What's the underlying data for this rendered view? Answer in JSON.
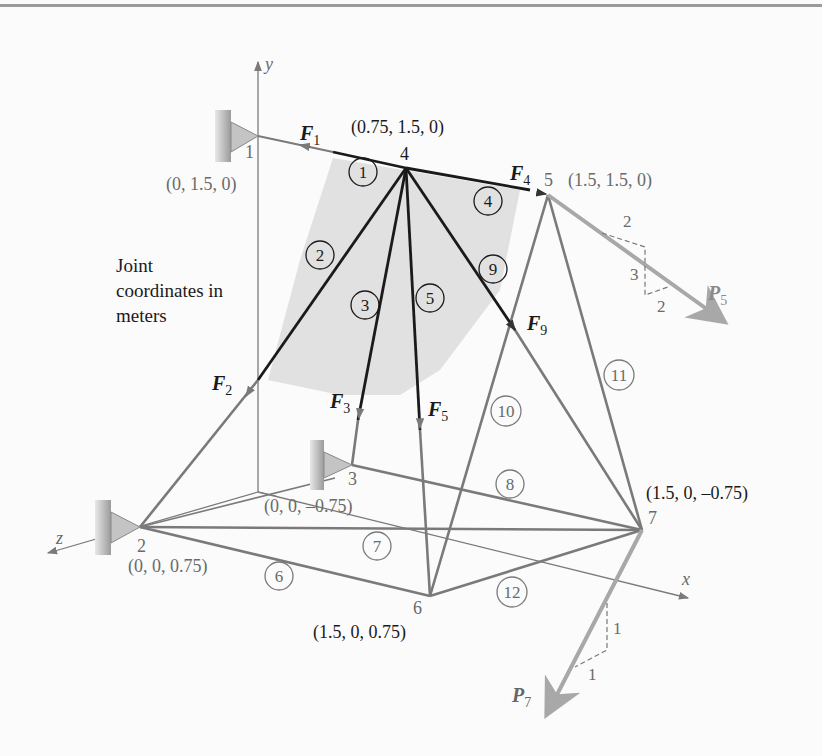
{
  "figure": {
    "note": "Joint coordinates in meters",
    "note_lines": [
      "Joint",
      "coordinates in",
      "meters"
    ],
    "axes": {
      "x": "x",
      "y": "y",
      "z": "z"
    },
    "joints": [
      {
        "id": "1",
        "coords": "(0, 1.5, 0)"
      },
      {
        "id": "2",
        "coords": "(0, 0, 0.75)"
      },
      {
        "id": "3",
        "coords": "(0, 0, –0.75)"
      },
      {
        "id": "4",
        "coords": "(0.75, 1.5, 0)"
      },
      {
        "id": "5",
        "coords": "(1.5, 1.5, 0)"
      },
      {
        "id": "6",
        "coords": "(1.5, 0, 0.75)"
      },
      {
        "id": "7",
        "coords": "(1.5, 0, –0.75)"
      }
    ],
    "members": [
      "1",
      "2",
      "3",
      "4",
      "5",
      "6",
      "7",
      "8",
      "9",
      "10",
      "11",
      "12"
    ],
    "forces": {
      "F1": {
        "sym": "F",
        "sub": "1"
      },
      "F2": {
        "sym": "F",
        "sub": "2"
      },
      "F3": {
        "sym": "F",
        "sub": "3"
      },
      "F4": {
        "sym": "F",
        "sub": "4"
      },
      "F5": {
        "sym": "F",
        "sub": "5"
      },
      "F9": {
        "sym": "F",
        "sub": "9"
      }
    },
    "loads": {
      "P5": {
        "sym": "P",
        "sub": "5",
        "slope_a": "2",
        "slope_b": "3",
        "slope_c": "2"
      },
      "P7": {
        "sym": "P",
        "sub": "7",
        "slope_a": "1",
        "slope_b": "1"
      }
    },
    "colors": {
      "dark_member": "#1a1a1a",
      "gray_member": "#7a7a7a",
      "load_arrow": "#a8a8a8",
      "highlight": "#dcdcdc",
      "label_gray": "#6a6a6a"
    }
  }
}
